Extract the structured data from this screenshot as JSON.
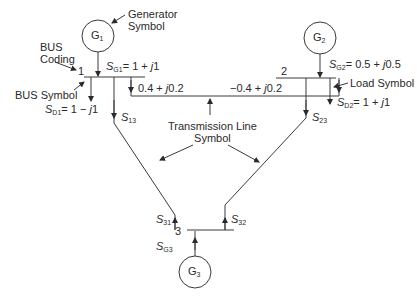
{
  "diagram": {
    "type": "power-system one-line diagram",
    "buses": [
      {
        "id": "1",
        "label": "1"
      },
      {
        "id": "2",
        "label": "2"
      },
      {
        "id": "3",
        "label": "3"
      }
    ],
    "generators": [
      {
        "name": "G",
        "sub": "1"
      },
      {
        "name": "G",
        "sub": "2"
      },
      {
        "name": "G",
        "sub": "3"
      }
    ],
    "quantities": {
      "sg1": {
        "sym": "S",
        "sub": "G1",
        "value": "= 1 + ",
        "j": "j",
        "tail": "1"
      },
      "sd1": {
        "sym": "S",
        "sub": "D1",
        "value": "= 1 − ",
        "j": "j",
        "tail": "1"
      },
      "sg2": {
        "sym": "S",
        "sub": "G2",
        "value": "= 0.5 + ",
        "j": "j",
        "tail": "0.5"
      },
      "sd2": {
        "sym": "S",
        "sub": "D2",
        "value": "= 1 + ",
        "j": "j",
        "tail": "1"
      },
      "s13": {
        "sym": "S",
        "sub": "13"
      },
      "s23": {
        "sym": "S",
        "sub": "23"
      },
      "s31": {
        "sym": "S",
        "sub": "31"
      },
      "s32": {
        "sym": "S",
        "sub": "32"
      },
      "sg3": {
        "sym": "S",
        "sub": "G3"
      },
      "flow12": {
        "value": "0.4 + ",
        "j": "j",
        "tail": "0.2"
      },
      "flow21": {
        "value": "−0.4 + ",
        "j": "j",
        "tail": "0.2"
      }
    },
    "annotations": {
      "generator_symbol": [
        "Generator",
        "Symbol"
      ],
      "bus_coding": [
        "BUS",
        "Coding"
      ],
      "bus_symbol": "BUS Symbol",
      "load_symbol": "Load Symbol",
      "transmission_line_symbol": [
        "Transmission Line",
        "Symbol"
      ]
    },
    "colors": {
      "line": "#3a3a3a",
      "text": "#2a2a2a"
    }
  }
}
